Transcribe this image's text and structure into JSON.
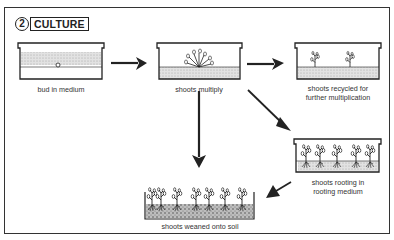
{
  "header": {
    "step_number": "2",
    "title": "CULTURE"
  },
  "stages": [
    {
      "id": "bud",
      "label": "bud in medium"
    },
    {
      "id": "multiply",
      "label": "shoots multiply"
    },
    {
      "id": "recycled",
      "label_line1": "shoots recycled for",
      "label_line2": "further multiplication"
    },
    {
      "id": "rooting",
      "label_line1": "shoots rooting in",
      "label_line2": "rooting medium"
    },
    {
      "id": "weaned",
      "label": "shoots weaned onto soil"
    }
  ],
  "icons": [
    "culture-container",
    "plant-shoot",
    "arrow"
  ],
  "colors": {
    "ink": "#222222",
    "medium": "#d6d6d6",
    "soil": "#9a9a9a",
    "background": "#ffffff"
  }
}
